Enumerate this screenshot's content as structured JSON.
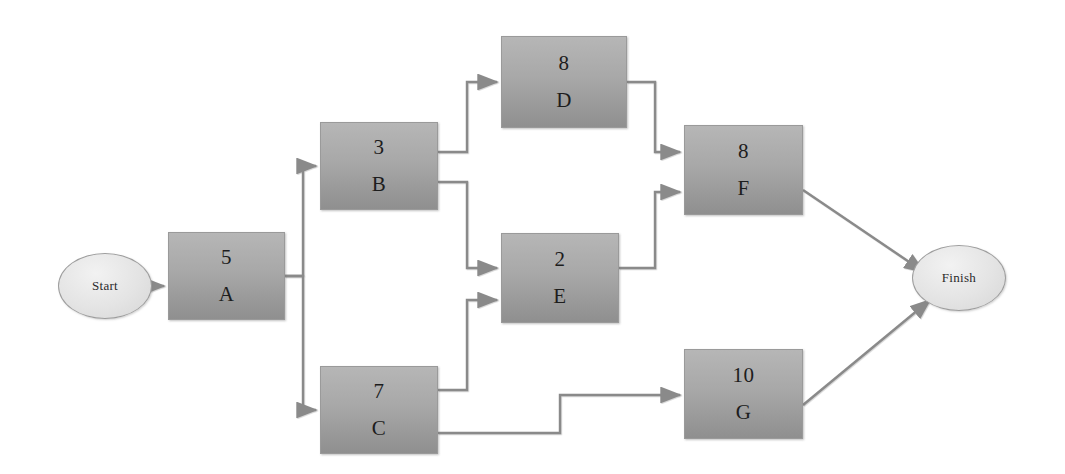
{
  "diagram": {
    "type": "activity-on-node-network",
    "start_label": "Start",
    "finish_label": "Finish",
    "edge_color": "#8a8a8a",
    "node_fill_top": "#b6b6b6",
    "node_fill_bottom": "#8f8f8f",
    "terminator_fill": "#e4e4e4",
    "text_color": "#1d1d1d",
    "background": "#ffffff"
  },
  "nodes": [
    {
      "id": "A",
      "label": "A",
      "duration": "5",
      "x": 168,
      "y": 232,
      "w": 117,
      "h": 88
    },
    {
      "id": "B",
      "label": "B",
      "duration": "3",
      "x": 320,
      "y": 122,
      "w": 118,
      "h": 88
    },
    {
      "id": "C",
      "label": "C",
      "duration": "7",
      "x": 320,
      "y": 366,
      "w": 118,
      "h": 88
    },
    {
      "id": "D",
      "label": "D",
      "duration": "8",
      "x": 501,
      "y": 36,
      "w": 126,
      "h": 92
    },
    {
      "id": "E",
      "label": "E",
      "duration": "2",
      "x": 501,
      "y": 233,
      "w": 118,
      "h": 90
    },
    {
      "id": "F",
      "label": "F",
      "duration": "8",
      "x": 684,
      "y": 125,
      "w": 119,
      "h": 90
    },
    {
      "id": "G",
      "label": "G",
      "duration": "10",
      "x": 684,
      "y": 349,
      "w": 119,
      "h": 90
    }
  ],
  "terminators": [
    {
      "id": "start",
      "label": "Start",
      "x": 58,
      "y": 253,
      "w": 94,
      "h": 66
    },
    {
      "id": "finish",
      "label": "Finish",
      "x": 912,
      "y": 245,
      "w": 94,
      "h": 66
    }
  ],
  "edges": [
    {
      "id": "start-a",
      "from": "Start",
      "to": "A",
      "path": "M 152 286 L 164 286"
    },
    {
      "id": "a-b",
      "from": "A",
      "to": "B",
      "path": "M 285 276 L 303 276 L 303 166 L 316 166"
    },
    {
      "id": "a-c",
      "from": "A",
      "to": "C",
      "path": "M 285 276 L 303 276 L 303 410 L 316 410"
    },
    {
      "id": "b-d",
      "from": "B",
      "to": "D",
      "path": "M 438 152 L 467 152 L 467 82 L 497 82"
    },
    {
      "id": "b-e",
      "from": "B",
      "to": "E",
      "path": "M 438 182 L 467 182 L 467 268 L 497 268"
    },
    {
      "id": "c-e",
      "from": "C",
      "to": "E",
      "path": "M 438 390 L 467 390 L 467 300 L 497 300"
    },
    {
      "id": "c-g",
      "from": "C",
      "to": "G",
      "path": "M 438 433 L 560 433 L 560 395 L 680 395"
    },
    {
      "id": "d-f",
      "from": "D",
      "to": "F",
      "path": "M 627 82 L 655 82 L 655 152 L 680 152"
    },
    {
      "id": "e-f",
      "from": "E",
      "to": "F",
      "path": "M 619 268 L 655 268 L 655 192 L 680 192"
    },
    {
      "id": "f-finish",
      "from": "F",
      "to": "Finish",
      "path": "M 803 190 L 924 272"
    },
    {
      "id": "g-finish",
      "from": "G",
      "to": "Finish",
      "path": "M 803 405 L 930 300"
    }
  ]
}
